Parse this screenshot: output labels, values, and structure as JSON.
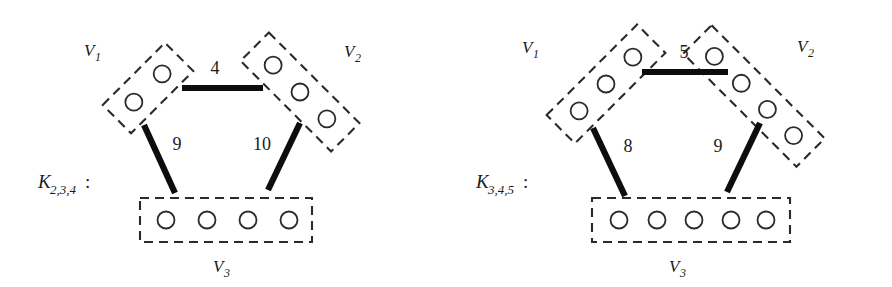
{
  "figure": {
    "title_visible": false,
    "background_color": "#ffffff",
    "ink_color": "#1a1a1a",
    "edge_color": "#0d0d0d",
    "box_stroke_color": "#2a2a2a",
    "panel_count": 2
  },
  "panels": [
    {
      "id": "left",
      "name_text": "K",
      "name_subscript": "2,3,4",
      "name_colon": ":",
      "name_full": "K2,3,4 :",
      "parts": [
        {
          "label": "V",
          "sub": "1",
          "label_full": "V1",
          "node_count": 2,
          "orientation": "tilted-down-left",
          "rotation_deg": -45
        },
        {
          "label": "V",
          "sub": "2",
          "label_full": "V2",
          "node_count": 3,
          "orientation": "tilted-down-right",
          "rotation_deg": 45
        },
        {
          "label": "V",
          "sub": "3",
          "label_full": "V3",
          "node_count": 4,
          "orientation": "horizontal",
          "rotation_deg": 0
        }
      ],
      "edges": [
        {
          "between": "V1-V2",
          "weight": "4",
          "position": "top"
        },
        {
          "between": "V1-V3",
          "weight": "9",
          "position": "left"
        },
        {
          "between": "V2-V3",
          "weight": "10",
          "position": "right"
        }
      ]
    },
    {
      "id": "right",
      "name_text": "K",
      "name_subscript": "3,4,5",
      "name_colon": ":",
      "name_full": "K3,4,5 :",
      "parts": [
        {
          "label": "V",
          "sub": "1",
          "label_full": "V1",
          "node_count": 3,
          "orientation": "tilted-down-left",
          "rotation_deg": -45
        },
        {
          "label": "V",
          "sub": "2",
          "label_full": "V2",
          "node_count": 4,
          "orientation": "tilted-down-right",
          "rotation_deg": 45
        },
        {
          "label": "V",
          "sub": "3",
          "label_full": "V3",
          "node_count": 5,
          "orientation": "horizontal",
          "rotation_deg": 0
        }
      ],
      "edges": [
        {
          "between": "V1-V2",
          "weight": "5",
          "position": "top"
        },
        {
          "between": "V1-V3",
          "weight": "8",
          "position": "left"
        },
        {
          "between": "V2-V3",
          "weight": "9",
          "position": "right"
        }
      ]
    }
  ]
}
